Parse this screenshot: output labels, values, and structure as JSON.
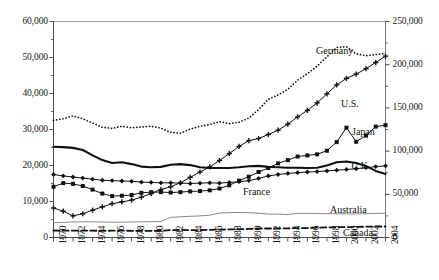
{
  "chart_data": {
    "type": "line",
    "title": "",
    "subtitle": "",
    "xlabel": "",
    "ylabel": "",
    "grid": false,
    "legend_position": "inline-right-of-series",
    "x": [
      1970,
      1971,
      1972,
      1973,
      1974,
      1975,
      1976,
      1977,
      1978,
      1979,
      1980,
      1981,
      1982,
      1983,
      1984,
      1985,
      1986,
      1987,
      1988,
      1989,
      1990,
      1991,
      1992,
      1993,
      1994,
      1995,
      1996,
      1997,
      1998,
      1999,
      2000,
      2001,
      2002,
      2003,
      2004
    ],
    "xtick_labels": [
      "1970",
      "1972",
      "1974",
      "1976",
      "1978",
      "1980",
      "1982",
      "1984",
      "1986",
      "1988",
      "1990",
      "1992",
      "1994",
      "1996",
      "1998",
      "2000",
      "2002",
      "2004"
    ],
    "xlim": [
      1970,
      2004
    ],
    "xtick_step_labeled": 2,
    "xtick_step_minor": 1,
    "left_axis": {
      "ylim": [
        0,
        60000
      ],
      "tick_labels": [
        "0",
        "10,000",
        "20,000",
        "30,000",
        "40,000",
        "50,000",
        "60,000"
      ],
      "tick_values": [
        0,
        10000,
        20000,
        30000,
        40000,
        50000,
        60000
      ],
      "minor_tick_step": 5000
    },
    "right_axis": {
      "ylim": [
        0,
        250000
      ],
      "tick_labels": [
        "0",
        "50,000",
        "100,000",
        "150,000",
        "200,000",
        "250,000"
      ],
      "tick_values": [
        0,
        50000,
        100000,
        150000,
        200000,
        250000
      ],
      "minor_tick_step": 25000
    },
    "series": [
      {
        "name": "Germany",
        "label": "Germany",
        "style": "dotted",
        "marker": "none",
        "color": "#111111",
        "axis": "left",
        "values": [
          32500,
          33000,
          33800,
          33000,
          31800,
          30600,
          30300,
          30900,
          30500,
          30700,
          30900,
          30400,
          29200,
          29000,
          30100,
          30900,
          31400,
          32200,
          31600,
          32000,
          33200,
          35500,
          38400,
          39600,
          41200,
          43700,
          45500,
          47600,
          50200,
          52800,
          53000,
          51000,
          50500,
          50800,
          51200
        ]
      },
      {
        "name": "U.S.",
        "label": "U.S.",
        "style": "solid",
        "marker": "plus",
        "color": "#111111",
        "axis": "left",
        "values": [
          8200,
          7300,
          6000,
          6600,
          7600,
          8500,
          9400,
          9900,
          10400,
          11200,
          12200,
          13300,
          14100,
          15200,
          16700,
          18200,
          19600,
          21400,
          23300,
          25300,
          26900,
          27500,
          28600,
          29800,
          31500,
          33500,
          35300,
          37400,
          39900,
          42400,
          44200,
          45400,
          46900,
          48600,
          50400
        ]
      },
      {
        "name": "Japan",
        "label": "Japan",
        "style": "solid",
        "marker": "square",
        "color": "#111111",
        "axis": "left",
        "values": [
          14100,
          15100,
          14900,
          14300,
          13300,
          12200,
          11500,
          11600,
          11800,
          12400,
          12600,
          12600,
          12500,
          12600,
          12800,
          12900,
          13100,
          13600,
          14500,
          15800,
          16900,
          18200,
          19300,
          20600,
          21500,
          22500,
          22800,
          23100,
          24100,
          26500,
          30500,
          26600,
          28300,
          30800,
          31200
        ]
      },
      {
        "name": "U.K.",
        "label": "U.K.",
        "style": "solid-thick",
        "marker": "none",
        "color": "#111111",
        "axis": "left",
        "values": [
          25200,
          25100,
          24900,
          24300,
          22800,
          21500,
          20700,
          20900,
          20400,
          19700,
          19500,
          19600,
          20200,
          20400,
          20100,
          19500,
          19300,
          19300,
          19300,
          19500,
          19800,
          19900,
          19600,
          19500,
          19400,
          19400,
          19300,
          19400,
          20000,
          20900,
          21100,
          20700,
          19900,
          18500,
          17600
        ]
      },
      {
        "name": "France",
        "label": "France",
        "style": "solid",
        "marker": "diamond",
        "color": "#111111",
        "axis": "left",
        "values": [
          17500,
          17100,
          16800,
          16500,
          16200,
          15900,
          15800,
          15700,
          15600,
          15400,
          15300,
          15200,
          15200,
          15100,
          15000,
          15100,
          15200,
          15100,
          15300,
          15500,
          15800,
          16400,
          17100,
          17500,
          17800,
          18000,
          18200,
          18300,
          18500,
          18700,
          18900,
          19100,
          19400,
          19700,
          19900
        ]
      },
      {
        "name": "Australia",
        "label": "Australia",
        "style": "solid-thin",
        "marker": "none",
        "color": "#7a7a7a",
        "axis": "left",
        "values": [
          4100,
          4200,
          4300,
          4350,
          4350,
          4300,
          4250,
          4250,
          4300,
          4350,
          4400,
          4450,
          5600,
          5750,
          5900,
          6000,
          6200,
          6800,
          6900,
          6950,
          6900,
          6750,
          6500,
          6500,
          6400,
          6700,
          6700,
          6650,
          6600,
          6600,
          6550,
          6550,
          6600,
          6700,
          6750
        ]
      },
      {
        "name": "Canada",
        "label": "Canada",
        "style": "dashed",
        "marker": "none",
        "color": "#111111",
        "axis": "left",
        "values": [
          1950,
          1900,
          1900,
          1900,
          1880,
          1870,
          1900,
          1900,
          1850,
          1820,
          1830,
          1850,
          2050,
          2100,
          2050,
          2050,
          2150,
          2200,
          2250,
          2300,
          2400,
          2500,
          2500,
          2500,
          2550,
          2600,
          2650,
          2750,
          2800,
          2850,
          2900,
          2950,
          3000,
          3050,
          3050
        ]
      }
    ],
    "series_label_positions": [
      {
        "name": "Germany",
        "x": 316,
        "y": 45
      },
      {
        "name": "U.S.",
        "x": 341,
        "y": 98
      },
      {
        "name": "Japan",
        "x": 352,
        "y": 126
      },
      {
        "name": "U.K.",
        "x": 351,
        "y": 160
      },
      {
        "name": "France",
        "x": 243,
        "y": 186
      },
      {
        "name": "Australia",
        "x": 330,
        "y": 204
      },
      {
        "name": "Canada",
        "x": 343,
        "y": 227
      }
    ]
  }
}
